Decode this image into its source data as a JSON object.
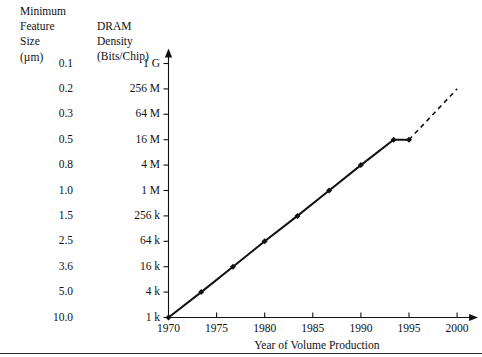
{
  "headers": {
    "feature_column": "Minimum\nFeature\nSize\n(µm)",
    "density_column": "DRAM\nDensity\n(Bits/Chip)"
  },
  "chart_data": {
    "type": "line",
    "title": "",
    "xlabel": "Year of Volume Production",
    "ylabel": "DRAM Density (Bits/Chip)",
    "y2label": "Minimum Feature Size (µm)",
    "grid": false,
    "legend": null,
    "xlim": [
      1970,
      2001
    ],
    "xticks": [
      "1970",
      "1975",
      "1980",
      "1985",
      "1990",
      "1995",
      "2000"
    ],
    "xtick_values": [
      1970,
      1975,
      1980,
      1985,
      1990,
      1995,
      2000
    ],
    "yticks": [
      "1 k",
      "4 k",
      "16 k",
      "64 k",
      "256 k",
      "1 M",
      "4 M",
      "16 M",
      "64 M",
      "256 M",
      "1 G"
    ],
    "ytick_values": [
      1024,
      4096,
      16384,
      65536,
      262144,
      1048576,
      4194304,
      16777216,
      67108864,
      268435456,
      1073741824
    ],
    "feature_size_ticks": [
      "10.0",
      "5.0",
      "3.6",
      "2.5",
      "1.5",
      "1.0",
      "0.8",
      "0.5",
      "0.3",
      "0.2",
      "0.1"
    ],
    "series": [
      {
        "name": "DRAM density trend",
        "style": "solid",
        "marker": "diamond",
        "x": [
          1970,
          1973.4,
          1976.7,
          1980.0,
          1983.4,
          1986.7,
          1990.0,
          1993.4,
          1995.0
        ],
        "y_labels": [
          "1 k",
          "4 k",
          "16 k",
          "64 k",
          "256 k",
          "1 M",
          "4 M",
          "16 M",
          "16 M"
        ],
        "y": [
          1024,
          4096,
          16384,
          65536,
          262144,
          1048576,
          4194304,
          16777216,
          16777216
        ]
      },
      {
        "name": "projected trend",
        "style": "dashed",
        "marker": "none",
        "x": [
          1995.0,
          2000.0
        ],
        "y_labels": [
          "16 M",
          "256 M"
        ],
        "y": [
          16777216,
          268435456
        ]
      }
    ]
  },
  "colors": {
    "axis": "#111111",
    "line": "#111111",
    "text": "#111111",
    "rule": "#2b2b2b"
  }
}
